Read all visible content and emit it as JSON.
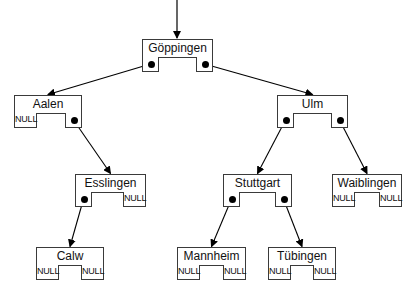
{
  "diagram": {
    "title": "",
    "type": "binary-search-tree",
    "root_arrow": {
      "x": 177,
      "y1": 0,
      "y2": 38
    },
    "null_label": "NULL",
    "nodes": [
      {
        "id": "goeppingen",
        "label": "Göppingen",
        "x": 142,
        "y": 39,
        "w": 71,
        "left": "pointer",
        "right": "pointer"
      },
      {
        "id": "aalen",
        "label": "Aalen",
        "x": 14,
        "y": 95,
        "w": 68,
        "left": "NULL",
        "right": "pointer"
      },
      {
        "id": "ulm",
        "label": "Ulm",
        "x": 277,
        "y": 95,
        "w": 71,
        "left": "pointer",
        "right": "pointer"
      },
      {
        "id": "esslingen",
        "label": "Esslingen",
        "x": 75,
        "y": 174,
        "w": 71,
        "left": "pointer",
        "right": "NULL"
      },
      {
        "id": "stuttgart",
        "label": "Stuttgart",
        "x": 223,
        "y": 174,
        "w": 69,
        "left": "pointer",
        "right": "pointer"
      },
      {
        "id": "waiblingen",
        "label": "Waiblingen",
        "x": 332,
        "y": 174,
        "w": 70,
        "left": "NULL",
        "right": "NULL"
      },
      {
        "id": "calw",
        "label": "Calw",
        "x": 36,
        "y": 247,
        "w": 68,
        "left": "NULL",
        "right": "NULL"
      },
      {
        "id": "mannheim",
        "label": "Mannheim",
        "x": 177,
        "y": 247,
        "w": 69,
        "left": "NULL",
        "right": "NULL"
      },
      {
        "id": "tuebingen",
        "label": "Tübingen",
        "x": 268,
        "y": 247,
        "w": 68,
        "left": "NULL",
        "right": "NULL"
      }
    ],
    "edges": [
      {
        "from": "goeppingen",
        "side": "left",
        "to": "aalen"
      },
      {
        "from": "goeppingen",
        "side": "right",
        "to": "ulm"
      },
      {
        "from": "aalen",
        "side": "right",
        "to": "esslingen"
      },
      {
        "from": "ulm",
        "side": "left",
        "to": "stuttgart"
      },
      {
        "from": "ulm",
        "side": "right",
        "to": "waiblingen"
      },
      {
        "from": "esslingen",
        "side": "left",
        "to": "calw"
      },
      {
        "from": "stuttgart",
        "side": "left",
        "to": "mannheim"
      },
      {
        "from": "stuttgart",
        "side": "right",
        "to": "tuebingen"
      }
    ],
    "style": {
      "header_height": 18,
      "pointer_height": 15,
      "pointer_width": 17,
      "null_width": 23,
      "line_color": "#3a3a3a",
      "background": "#ffffff"
    }
  }
}
